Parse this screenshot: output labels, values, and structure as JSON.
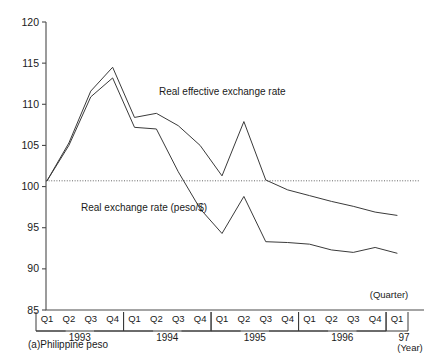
{
  "chart_data": {
    "type": "line",
    "title": "",
    "subtitle": "",
    "xlabel": "(Quarter)",
    "xlabel2": "(Year)",
    "ylabel": "",
    "ylim": [
      85,
      120
    ],
    "yticks": [
      85,
      90,
      95,
      100,
      105,
      110,
      115,
      120
    ],
    "ytick_labels": [
      "85",
      "90",
      "95",
      "100",
      "105",
      "110",
      "115",
      "120"
    ],
    "grid": false,
    "legend_position": "inline-annotation",
    "reference_line": {
      "value": 100.7,
      "style": "dotted"
    },
    "x": [
      "Q1",
      "Q2",
      "Q3",
      "Q4",
      "Q1",
      "Q2",
      "Q3",
      "Q4",
      "Q1",
      "Q2",
      "Q3",
      "Q4",
      "Q1",
      "Q2",
      "Q3",
      "Q4",
      "Q1"
    ],
    "x_groups": [
      {
        "year": "1993",
        "quarters": [
          "Q1",
          "Q2",
          "Q3",
          "Q4"
        ]
      },
      {
        "year": "1994",
        "quarters": [
          "Q1",
          "Q2",
          "Q3",
          "Q4"
        ]
      },
      {
        "year": "1995",
        "quarters": [
          "Q1",
          "Q2",
          "Q3",
          "Q4"
        ]
      },
      {
        "year": "1996",
        "quarters": [
          "Q1",
          "Q2",
          "Q3",
          "Q4"
        ]
      },
      {
        "year": "97",
        "quarters": [
          "Q1"
        ]
      }
    ],
    "series": [
      {
        "name": "Real effective exchange rate",
        "color": "#3a3a3a",
        "values": [
          100.7,
          105.3,
          111.6,
          114.5,
          108.4,
          108.9,
          107.4,
          105.0,
          101.3,
          107.9,
          100.8,
          99.6,
          98.9,
          98.2,
          97.6,
          96.9,
          96.5
        ]
      },
      {
        "name": "Real exchange rate (peso/$)",
        "color": "#3a3a3a",
        "values": [
          100.7,
          105.0,
          110.9,
          113.2,
          107.2,
          107.0,
          101.8,
          97.3,
          94.3,
          98.8,
          93.3,
          93.2,
          93.0,
          92.3,
          92.0,
          92.6,
          91.9
        ]
      }
    ],
    "annotations": [
      {
        "text": "Real effective exchange rate",
        "x_px": 159,
        "y_px": 95
      },
      {
        "text": "Real exchange rate (peso/$)",
        "x_px": 81,
        "y_px": 211
      }
    ],
    "footnote": "(a)Philippine peso"
  }
}
